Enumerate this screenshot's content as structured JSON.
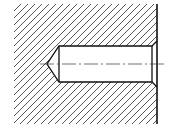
{
  "diagram": {
    "colors": {
      "line": "#111111",
      "hatch": "#555555",
      "background": "#ffffff"
    },
    "section_area": {
      "x": 14,
      "y": 4,
      "width": 143,
      "height": 120
    },
    "hatch_spacing": 7,
    "hole": {
      "left_x": 59,
      "right_x": 152,
      "top_y": 46,
      "bottom_y": 82,
      "tip_x": 47,
      "tip_y": 64,
      "chamfer_x": 157,
      "chamfer_top_y": 41,
      "chamfer_bottom_y": 87
    },
    "centerline": {
      "x1": 40,
      "x2": 166,
      "y": 64
    },
    "surface_edge": {
      "x": 157,
      "y1": 4,
      "y2": 124
    }
  }
}
